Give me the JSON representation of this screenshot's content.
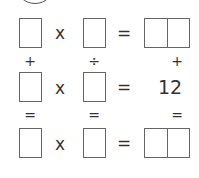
{
  "puzzle": {
    "row1": {
      "op1": "x",
      "eq": "="
    },
    "col_ops": {
      "col1": "+",
      "col2": "÷",
      "col3": "+"
    },
    "row2": {
      "op1": "x",
      "eq": "=",
      "result": "12"
    },
    "col_eqs": {
      "col1": "=",
      "col2": "=",
      "col3": "="
    },
    "row3": {
      "op1": "x",
      "eq": "="
    }
  }
}
